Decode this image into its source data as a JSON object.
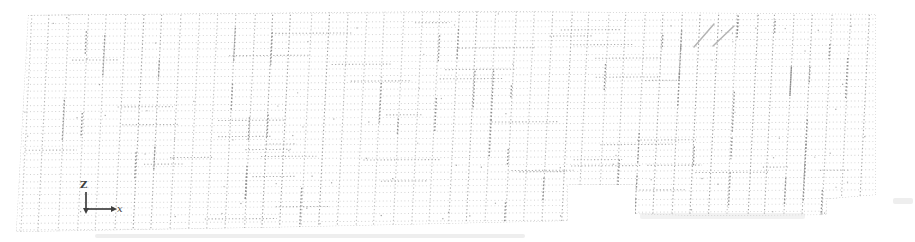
{
  "figure": {
    "width": 915,
    "height": 242,
    "background": "#ffffff",
    "axis_triad": {
      "z_label": "Z",
      "x_label": "x",
      "color": "#3f3f3f",
      "origin_x": 86,
      "origin_y": 209,
      "z_top_y": 192,
      "x_end_x": 113
    },
    "mesh": {
      "seed": 7,
      "boundary": [
        [
          28,
          15
        ],
        [
          470,
          11
        ],
        [
          876,
          14
        ],
        [
          876,
          195
        ],
        [
          827,
          199
        ],
        [
          827,
          215
        ],
        [
          700,
          216
        ],
        [
          635,
          214
        ],
        [
          635,
          185
        ],
        [
          568,
          185
        ],
        [
          568,
          221
        ],
        [
          300,
          227
        ],
        [
          16,
          232
        ]
      ],
      "verticals": {
        "x_start": 32,
        "spacing": 18.6,
        "count": 46,
        "lean": -12,
        "shades": [
          "#9c9c9c",
          "#a8a8a8",
          "#b6b6b6",
          "#c2c2c2"
        ],
        "dash": "1.3 2.3",
        "width": 1.1
      },
      "horizontals": {
        "y_start": 16,
        "spacing": 6.9,
        "count": 32,
        "slope": -5,
        "shades": [
          "#d4d4d4",
          "#dadada",
          "#cfcfcf"
        ],
        "dash": "1 2.6",
        "width": 1
      },
      "dark_vertical_segments": {
        "count": 55,
        "color": "#8f8f8f"
      },
      "dark_horizontal_segments": {
        "count": 45,
        "color": "#aeaeae"
      },
      "specks": {
        "count": 90,
        "color": "#9a9a9a"
      },
      "border_color": "#bcbcbc",
      "diagonal_marks": [
        [
          694,
          47,
          714,
          24
        ],
        [
          713,
          46,
          734,
          26
        ]
      ],
      "diagonal_color": "#b4b4b4",
      "smudge_color": "#c6c6c6",
      "smudges": [
        {
          "x": 95,
          "y": 234,
          "w": 430,
          "h": 4,
          "opacity": 0.3
        },
        {
          "x": 640,
          "y": 213,
          "w": 165,
          "h": 6,
          "opacity": 0.22
        },
        {
          "x": 893,
          "y": 198,
          "w": 20,
          "h": 6,
          "opacity": 0.3
        }
      ]
    }
  }
}
